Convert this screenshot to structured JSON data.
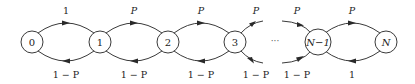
{
  "diagram": {
    "type": "markov-chain",
    "title": "",
    "nodes": [
      {
        "id": "0",
        "label": "0",
        "x": 32,
        "y": 42
      },
      {
        "id": "1",
        "label": "1",
        "x": 100,
        "y": 42
      },
      {
        "id": "2",
        "label": "2",
        "x": 168,
        "y": 42
      },
      {
        "id": "3",
        "label": "3",
        "x": 235,
        "y": 42
      },
      {
        "id": "N-1",
        "label": "N−1",
        "x": 318,
        "y": 42
      },
      {
        "id": "N",
        "label": "N",
        "x": 386,
        "y": 42
      }
    ],
    "ellipsis": "···",
    "edges_forward": [
      {
        "from": "0",
        "to": "1",
        "label": "1"
      },
      {
        "from": "1",
        "to": "2",
        "label": "P"
      },
      {
        "from": "2",
        "to": "3",
        "label": "P"
      },
      {
        "from": "3",
        "to": "…",
        "label": "P"
      },
      {
        "from": "…",
        "to": "N-1",
        "label": "P"
      },
      {
        "from": "N-1",
        "to": "N",
        "label": "P"
      }
    ],
    "edges_backward": [
      {
        "from": "1",
        "to": "0",
        "label": "1 − P"
      },
      {
        "from": "2",
        "to": "1",
        "label": "1 − P"
      },
      {
        "from": "3",
        "to": "2",
        "label": "1 − P"
      },
      {
        "from": "…",
        "to": "3",
        "label": "1 − P"
      },
      {
        "from": "N-1",
        "to": "…",
        "label": "1 − P"
      },
      {
        "from": "N",
        "to": "N-1",
        "label": "1"
      }
    ],
    "colors": {
      "stroke": "#3a3a3a",
      "text": "#222222",
      "background": "#ffffff"
    }
  }
}
